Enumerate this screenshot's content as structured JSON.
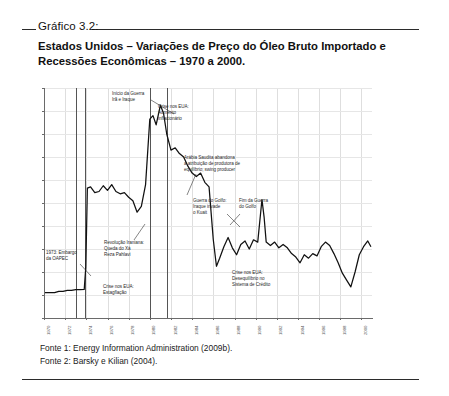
{
  "figure": {
    "caption_label": "Gráfico 3.2:",
    "title": "Estados Unidos – Variações de Preço do Óleo Bruto Importado e Recessões Econômicas – 1970 a 2000.",
    "sources": [
      "Fonte 1: Energy Information Administration (2009b).",
      "Fonte 2: Barsky e Kilian (2004)."
    ]
  },
  "chart_data": {
    "type": "line",
    "title": "Estados Unidos – Variações de Preço do Óleo Bruto Importado e Recessões Econômicas – 1970 a 2000.",
    "xlabel": "",
    "ylabel": "",
    "xlim": [
      1970,
      2001
    ],
    "ylim": [
      0,
      100
    ],
    "grid": true,
    "legend": "none",
    "ytick_labels": [
      "$100",
      "$90",
      "$80",
      "$70",
      "$60",
      "$50",
      "$40",
      "$30",
      "$20",
      "$10",
      "$-"
    ],
    "ytick_values": [
      100,
      90,
      80,
      70,
      60,
      50,
      40,
      30,
      20,
      10,
      0
    ],
    "xtick_labels": [
      "1970",
      "1972",
      "1974",
      "1976",
      "1978",
      "1980",
      "1982",
      "1984",
      "1986",
      "1988",
      "1990",
      "1992",
      "1994",
      "1996",
      "1998",
      "2000"
    ],
    "xtick_values": [
      1970,
      1972,
      1974,
      1976,
      1978,
      1980,
      1982,
      1984,
      1986,
      1988,
      1990,
      1992,
      1994,
      1996,
      1998,
      2000
    ],
    "series_name": "Preço do Óleo Bruto Importado (US$/barril, valores reais)",
    "x": [
      1970.0,
      1970.5,
      1971.0,
      1971.4,
      1971.8,
      1972.2,
      1972.6,
      1973.0,
      1973.4,
      1973.8,
      1973.95,
      1974.1,
      1974.4,
      1974.8,
      1975.2,
      1975.6,
      1976.0,
      1976.4,
      1976.8,
      1977.2,
      1977.6,
      1978.0,
      1978.4,
      1978.8,
      1979.2,
      1979.6,
      1980.0,
      1980.3,
      1980.6,
      1981.0,
      1981.3,
      1981.6,
      1982.0,
      1982.4,
      1982.8,
      1983.2,
      1983.6,
      1984.0,
      1984.4,
      1984.8,
      1985.2,
      1985.6,
      1986.0,
      1986.3,
      1986.6,
      1987.0,
      1987.4,
      1987.8,
      1988.2,
      1988.6,
      1989.0,
      1989.4,
      1989.8,
      1990.2,
      1990.6,
      1990.8,
      1991.0,
      1991.4,
      1991.8,
      1992.2,
      1992.6,
      1993.0,
      1993.4,
      1993.8,
      1994.2,
      1994.6,
      1995.0,
      1995.4,
      1995.8,
      1996.2,
      1996.6,
      1997.0,
      1997.4,
      1997.8,
      1998.2,
      1998.6,
      1999.0,
      1999.4,
      1999.8,
      2000.2,
      2000.6,
      2000.9
    ],
    "y": [
      11.0,
      11.0,
      11.0,
      11.6,
      11.6,
      12.0,
      12.0,
      12.3,
      12.3,
      12.4,
      22.0,
      56.5,
      57.0,
      54.5,
      55.0,
      57.5,
      55.5,
      58.0,
      55.0,
      54.0,
      54.5,
      52.5,
      51.0,
      46.0,
      48.5,
      58.0,
      86.5,
      88.0,
      84.0,
      92.5,
      89.0,
      80.0,
      73.0,
      74.0,
      71.5,
      70.0,
      66.0,
      63.0,
      61.5,
      63.0,
      59.0,
      57.0,
      34.0,
      22.5,
      26.0,
      31.0,
      35.0,
      30.5,
      27.5,
      32.0,
      33.5,
      30.0,
      34.0,
      33.0,
      51.5,
      44.0,
      33.0,
      31.5,
      33.0,
      30.5,
      32.0,
      30.5,
      28.0,
      26.5,
      24.0,
      27.5,
      26.0,
      28.0,
      27.0,
      31.0,
      33.0,
      31.5,
      28.0,
      24.0,
      19.5,
      16.5,
      13.5,
      20.0,
      27.5,
      31.0,
      33.5,
      31.0
    ],
    "recessions": [
      {
        "label": "Recessão 1973-1975",
        "x": 1973.0
      },
      {
        "label": "Recessão 1973-1975 fim",
        "x": 1973.9
      },
      {
        "label": "Recessão 1980",
        "x": 1980.0
      },
      {
        "label": "Recessão 1981-1982",
        "x": 1981.6
      }
    ],
    "annotations": [
      {
        "id": "oapec",
        "text": "1973: Embargo\nda OAPEC"
      },
      {
        "id": "stagflation",
        "text": "Crise nos EUA:\nEstagflação"
      },
      {
        "id": "iran-rev",
        "text": "Revolução Iraniana:\nQueda do Xá\nReza Pahlavi"
      },
      {
        "id": "iran-iraq",
        "text": "Início da Guerra\nIrã e Iraque"
      },
      {
        "id": "inflation",
        "text": "Crise nos EUA:\nAumento\ninflacionário"
      },
      {
        "id": "saudi",
        "text": "Arábia Saudita abandona\na atribuição de produtora de\nequilíbrio; swing producer"
      },
      {
        "id": "gulf-war",
        "text": "Guerra do Golfo:\nIraque invade\no Kuait"
      },
      {
        "id": "gulf-end",
        "text": "Fim da Guerra\ndo Golfo"
      },
      {
        "id": "credit",
        "text": "Crise nos EUA:\nDesequilíbrio no\nSistema de Crédito"
      }
    ],
    "colors": {
      "line": "#111111",
      "recession_bar": "#555555",
      "grid": "#dedede",
      "axis": "#6a6a6a"
    }
  }
}
